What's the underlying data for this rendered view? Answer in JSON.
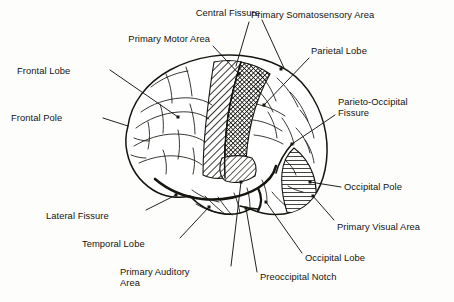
{
  "figure": {
    "view": "left lateral",
    "style": "black and white line drawing with hatched functional areas",
    "background_color": "#fdfdfc",
    "ink_color": "#15140f"
  },
  "labels": [
    {
      "id": "central-fissure",
      "text": "Central Fissure",
      "align": "right",
      "x": 160,
      "y": 8,
      "w": 100
    },
    {
      "id": "primary-motor-area",
      "text": "Primary Motor Area",
      "align": "right",
      "x": 60,
      "y": 34,
      "w": 150
    },
    {
      "id": "primary-somatosensory-area",
      "text": "Primary Somatosensory Area",
      "align": "left",
      "x": 251,
      "y": 10,
      "w": 165
    },
    {
      "id": "parietal-lobe",
      "text": "Parietal Lobe",
      "align": "left",
      "x": 311,
      "y": 46,
      "w": 95
    },
    {
      "id": "frontal-lobe",
      "text": "Frontal Lobe",
      "align": "left",
      "x": 17,
      "y": 66,
      "w": 90
    },
    {
      "id": "frontal-pole",
      "text": "Frontal Pole",
      "align": "left",
      "x": 11,
      "y": 113,
      "w": 90
    },
    {
      "id": "parieto-occipital-fissure",
      "text": "Parieto-Occipital\nFissure",
      "align": "left",
      "x": 338,
      "y": 97,
      "w": 110
    },
    {
      "id": "occipital-pole",
      "text": "Occipital Pole",
      "align": "left",
      "x": 344,
      "y": 182,
      "w": 100
    },
    {
      "id": "primary-visual-area",
      "text": "Primary Visual Area",
      "align": "left",
      "x": 337,
      "y": 222,
      "w": 117
    },
    {
      "id": "occipital-lobe",
      "text": "Occipital Lobe",
      "align": "left",
      "x": 305,
      "y": 253,
      "w": 100
    },
    {
      "id": "preoccipital-notch",
      "text": "Preoccipital Notch",
      "align": "left",
      "x": 260,
      "y": 272,
      "w": 115
    },
    {
      "id": "lateral-fissure",
      "text": "Lateral Fissure",
      "align": "left",
      "x": 46,
      "y": 211,
      "w": 100
    },
    {
      "id": "temporal-lobe",
      "text": "Temporal Lobe",
      "align": "left",
      "x": 82,
      "y": 239,
      "w": 100
    },
    {
      "id": "primary-auditory-area",
      "text": "Primary Auditory\nArea",
      "align": "left",
      "x": 120,
      "y": 267,
      "w": 110
    }
  ],
  "leader_lines": [
    {
      "id": "leader-central-fissure",
      "path": "M262,20 L284,68"
    },
    {
      "id": "leader-primary-motor-area",
      "path": "M213,46 L239,74"
    },
    {
      "id": "leader-primary-somatosensory-area",
      "path": "M249,22 L236,66"
    },
    {
      "id": "leader-parietal-lobe",
      "path": "M309,58 L264,105"
    },
    {
      "id": "leader-frontal-lobe",
      "path": "M110,70 L178,117"
    },
    {
      "id": "leader-frontal-pole",
      "path": "M103,118 L128,126"
    },
    {
      "id": "leader-parieto-occipital-fissure",
      "path": "M335,115 L292,144"
    },
    {
      "id": "leader-occipital-pole",
      "path": "M341,187 L310,182"
    },
    {
      "id": "leader-primary-visual-area",
      "path": "M334,220 L313,196"
    },
    {
      "id": "leader-occipital-lobe",
      "path": "M302,253 L266,202"
    },
    {
      "id": "leader-preoccipital-notch",
      "path": "M257,272 L246,208"
    },
    {
      "id": "leader-lateral-fissure",
      "path": "M146,210 L176,195"
    },
    {
      "id": "leader-temporal-lobe",
      "path": "M180,238 L209,207"
    },
    {
      "id": "leader-primary-auditory-area",
      "path": "M231,266 L241,182"
    }
  ],
  "anchor_points": [
    {
      "id": "anchor-primary-motor-area",
      "x": 239,
      "y": 74
    },
    {
      "id": "anchor-primary-somatosensory-area",
      "x": 281,
      "y": 69
    },
    {
      "id": "anchor-parietal-lobe",
      "x": 264,
      "y": 105
    },
    {
      "id": "anchor-frontal-lobe",
      "x": 178,
      "y": 117
    },
    {
      "id": "anchor-parieto-occipital-fissure",
      "x": 292,
      "y": 144
    },
    {
      "id": "anchor-occipital-pole",
      "x": 310,
      "y": 182
    },
    {
      "id": "anchor-primary-visual-area",
      "x": 313,
      "y": 196
    },
    {
      "id": "anchor-occipital-lobe",
      "x": 266,
      "y": 202
    },
    {
      "id": "anchor-preoccipital-notch",
      "x": 246,
      "y": 208
    },
    {
      "id": "anchor-lateral-fissure",
      "x": 176,
      "y": 195
    },
    {
      "id": "anchor-temporal-lobe",
      "x": 209,
      "y": 207
    },
    {
      "id": "anchor-primary-auditory-area",
      "x": 241,
      "y": 182
    }
  ],
  "regions": [
    {
      "id": "region-primary-motor-area",
      "name": "Primary Motor Area",
      "shading": "diagonal hatch, medium density"
    },
    {
      "id": "region-primary-somatosensory-area",
      "name": "Primary Somatosensory Area",
      "shading": "cross hatch, dark density"
    },
    {
      "id": "region-primary-visual-area",
      "name": "Primary Visual Area",
      "shading": "horizontal lines"
    },
    {
      "id": "region-primary-auditory-area",
      "name": "Primary Auditory Area",
      "shading": "diagonal hatch, light density"
    }
  ]
}
